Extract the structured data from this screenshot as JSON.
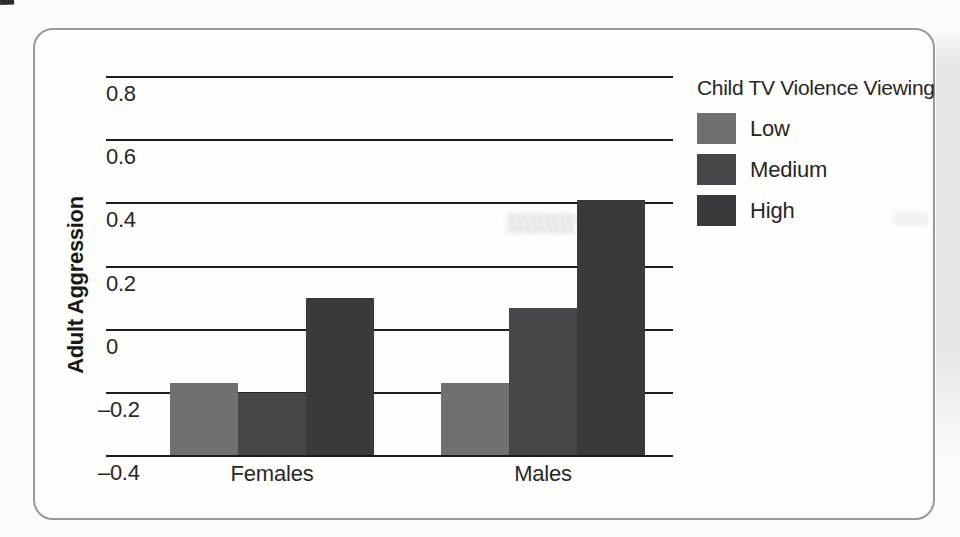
{
  "figure": {
    "kind": "scanned textbook bar chart panel",
    "style": {
      "page_background": "#fbfbf8",
      "panel_background": "#fefefc",
      "panel_border": "#999996",
      "gridline_color": "#1e1e1e",
      "text_color": "#262626",
      "page_edge_shade": "#e7e7e3"
    }
  },
  "chart_data": {
    "type": "bar",
    "title": "",
    "xlabel": "",
    "ylabel": "Adult Aggression",
    "categories": [
      "Females",
      "Males"
    ],
    "series": [
      {
        "name": "Low",
        "color": "#6f7072",
        "values": [
          -0.17,
          -0.17
        ]
      },
      {
        "name": "Medium",
        "color": "#46464a",
        "values": [
          -0.2,
          0.07
        ]
      },
      {
        "name": "High",
        "color": "#3a3a3e",
        "values": [
          0.1,
          0.41
        ]
      }
    ],
    "ylim": [
      -0.4,
      0.8
    ],
    "yticks": [
      0.8,
      0.6,
      0.4,
      0.2,
      0,
      -0.2,
      -0.4
    ],
    "ytick_labels": [
      "0.8",
      "0.6",
      "0.4",
      "0.2",
      "0",
      "–0.2",
      "–0.4"
    ],
    "grid": "horizontal",
    "legend_title": "Child TV Violence Viewing",
    "legend_position": "top-right",
    "legend_items": [
      "Low",
      "Medium",
      "High"
    ]
  }
}
